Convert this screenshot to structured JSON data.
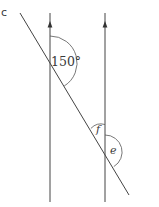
{
  "figure": {
    "corner_label": "c",
    "angles": {
      "given": "150°",
      "unknown_1": "f",
      "unknown_2": "e"
    },
    "elements": {
      "parallel_lines": 2,
      "transversal": 1,
      "arrowheads": "upward on both parallel lines"
    },
    "colors": {
      "line": "#444444",
      "text": "#3a3a3a",
      "background": "#ffffff"
    }
  }
}
